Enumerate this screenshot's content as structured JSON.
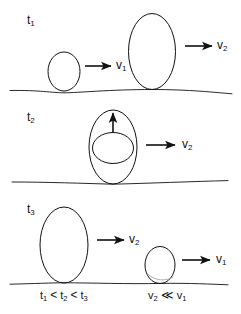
{
  "figure": {
    "type": "scientific-schematic",
    "background_color": "#ffffff",
    "stroke_color": "#111111",
    "width": 241,
    "height": 314
  },
  "rows": [
    {
      "id": "row-1",
      "time_label": "t",
      "time_subscript": "1",
      "baseline_y": 91,
      "shapes": [
        {
          "name": "small-bubble",
          "cx": 64,
          "cy": 71,
          "rx": 16,
          "ry": 19
        },
        {
          "name": "large-bubble",
          "cx": 152,
          "cy": 51,
          "rx": 24,
          "ry": 38
        }
      ],
      "arrows": [
        {
          "name": "velocity-arrow-v1",
          "x1": 85,
          "y1": 66,
          "x2": 112,
          "y2": 66,
          "label": "v",
          "sub": "1",
          "label_x": 117,
          "label_y": 60
        },
        {
          "name": "velocity-arrow-v2",
          "x1": 185,
          "y1": 46,
          "x2": 214,
          "y2": 46,
          "label": "v",
          "sub": "2",
          "label_x": 219,
          "label_y": 40
        }
      ]
    },
    {
      "id": "row-2",
      "time_label": "t",
      "time_subscript": "2",
      "baseline_y": 183,
      "shapes": [
        {
          "name": "outer-bubble",
          "cx": 113,
          "cy": 147,
          "rx": 24,
          "ry": 37
        },
        {
          "name": "inner-bubble",
          "cx": 113,
          "cy": 148,
          "rx": 20,
          "ry": 15
        }
      ],
      "arrows": [
        {
          "name": "upward-arrow",
          "x1": 113,
          "y1": 133,
          "x2": 113,
          "y2": 112,
          "label": "",
          "sub": "",
          "label_x": 0,
          "label_y": 0
        },
        {
          "name": "velocity-arrow-v2",
          "x1": 146,
          "y1": 145,
          "x2": 177,
          "y2": 145,
          "label": "v",
          "sub": "2",
          "label_x": 184,
          "label_y": 139
        }
      ]
    },
    {
      "id": "row-3",
      "time_label": "t",
      "time_subscript": "3",
      "baseline_y": 283,
      "shapes": [
        {
          "name": "large-bubble",
          "cx": 64,
          "cy": 245,
          "rx": 24,
          "ry": 38
        },
        {
          "name": "small-bubble",
          "cx": 160,
          "cy": 265,
          "rx": 15,
          "ry": 18
        }
      ],
      "arrows": [
        {
          "name": "velocity-arrow-v2",
          "x1": 97,
          "y1": 240,
          "x2": 126,
          "y2": 240,
          "label": "v",
          "sub": "2",
          "label_x": 131,
          "label_y": 234
        },
        {
          "name": "velocity-arrow-v1",
          "x1": 182,
          "y1": 260,
          "x2": 212,
          "y2": 260,
          "label": "v",
          "sub": "1",
          "label_x": 218,
          "label_y": 254
        }
      ]
    }
  ],
  "time_labels": [
    {
      "name": "time-label-t1",
      "base": "t",
      "sub": "1",
      "x": 27,
      "y": 17
    },
    {
      "name": "time-label-t2",
      "base": "t",
      "sub": "2",
      "x": 27,
      "y": 114
    },
    {
      "name": "time-label-t3",
      "base": "t",
      "sub": "3",
      "x": 27,
      "y": 206
    }
  ],
  "caption": {
    "time_relation": {
      "name": "time-ordering-caption",
      "terms": [
        "t",
        "t",
        "t"
      ],
      "subs": [
        "1",
        "2",
        "3"
      ],
      "operators": [
        "<",
        "<"
      ],
      "text": "t1 < t2 < t3",
      "x": 40,
      "y": 292
    },
    "velocity_relation": {
      "name": "velocity-ordering-caption",
      "terms": [
        "v",
        "v"
      ],
      "subs": [
        "2",
        "1"
      ],
      "operators": [
        "≪"
      ],
      "text": "v2 << v1",
      "x": 148,
      "y": 292
    }
  }
}
